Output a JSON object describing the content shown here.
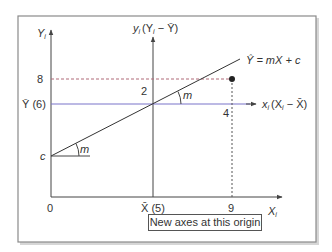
{
  "diagram": {
    "labels": {
      "y_axis": "Y",
      "y_axis_sub": "i",
      "x_axis": "X",
      "x_axis_sub": "i",
      "new_y_axis": "y",
      "new_y_axis_sub": "i",
      "new_y_axis_expr": "(Y",
      "new_y_axis_expr_sub": "i",
      "new_y_axis_expr_tail": " − Ȳ)",
      "new_x_axis": "x",
      "new_x_axis_sub": "i",
      "new_x_axis_expr": "(X",
      "new_x_axis_expr_sub": "i",
      "new_x_axis_expr_tail": " − X̄)",
      "regression_eq": "Ŷ = mX + c",
      "slope_upper": "m",
      "slope_lower": "m",
      "intercept": "c",
      "y_tick_8": "8",
      "y_mean": "Ȳ (6)",
      "x_origin": "0",
      "x_mean": "X̄ (5)",
      "x_tick_9": "9",
      "dev_y": "2",
      "dev_x": "4"
    },
    "caption": "New axes at this origin",
    "colors": {
      "frame": "#8a8a8a",
      "axis": "#444444",
      "mean_line": "#7b74c9",
      "dashed_line": "#b06a78",
      "dotted_line": "#555555",
      "regression_line": "#333333",
      "point": "#222222"
    }
  }
}
